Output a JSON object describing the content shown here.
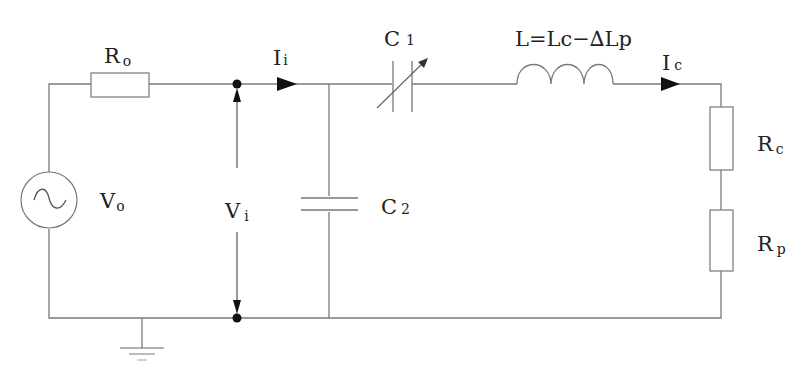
{
  "diagram": {
    "type": "circuit-schematic",
    "colors": {
      "wire": "#7a7a7a",
      "text": "#222222",
      "arrow": "#111111",
      "background": "#ffffff"
    },
    "labels": {
      "source_resistor": {
        "main": "R",
        "sub": "o"
      },
      "source_voltage": {
        "main": "V",
        "sub": "o"
      },
      "input_current": {
        "main": "I",
        "sub": "i"
      },
      "input_voltage": {
        "main": "V",
        "sub": "i"
      },
      "variable_capacitor": {
        "main": "C",
        "sub": "1"
      },
      "shunt_capacitor": {
        "main": "C",
        "sub": "2"
      },
      "inductor": {
        "text": "L=Lc−∆Lp"
      },
      "coil_current": {
        "main": "I",
        "sub": "c"
      },
      "coil_resistor": {
        "main": "R",
        "sub": "c"
      },
      "plasma_resistor": {
        "main": "R",
        "sub": "p"
      }
    },
    "components": [
      "ac-voltage-source",
      "resistor-Ro",
      "node-top",
      "node-bottom",
      "capacitor-C2",
      "variable-capacitor-C1",
      "inductor-L",
      "resistor-Rc",
      "resistor-Rp",
      "ground"
    ]
  }
}
